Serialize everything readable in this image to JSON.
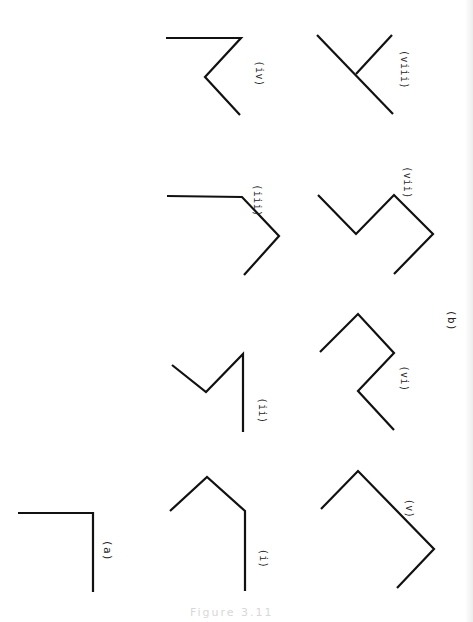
{
  "figure": {
    "caption": "Figure 3.11",
    "stroke_color": "#111111",
    "background": "#ffffff",
    "group_labels": [
      {
        "id": "a",
        "text": "(a)",
        "x": 107,
        "y": 550
      },
      {
        "id": "b",
        "text": "(b)",
        "x": 451,
        "y": 320
      }
    ],
    "panels": [
      {
        "id": "a",
        "label": "(a)",
        "points": [
          [
            18,
            513
          ],
          [
            93,
            513
          ],
          [
            93,
            592
          ]
        ],
        "branch": null
      },
      {
        "id": "i",
        "label": "(i)",
        "label_pos": [
          264,
          558
        ],
        "points": [
          [
            170,
            511
          ],
          [
            207,
            477
          ],
          [
            245,
            511
          ],
          [
            245,
            591
          ]
        ],
        "branch": null
      },
      {
        "id": "ii",
        "label": "(ii)",
        "label_pos": [
          262,
          410
        ],
        "points": [
          [
            172,
            365
          ],
          [
            206,
            392
          ],
          [
            243,
            354
          ],
          [
            243,
            432
          ]
        ],
        "branch": null
      },
      {
        "id": "iii",
        "label": "(iii)",
        "label_pos": [
          257,
          200
        ],
        "points": [
          [
            167,
            196
          ],
          [
            242,
            197
          ],
          [
            279,
            236
          ],
          [
            244,
            275
          ]
        ],
        "branch": null
      },
      {
        "id": "iv",
        "label": "(iv)",
        "label_pos": [
          259,
          73
        ],
        "points": [
          [
            166,
            38
          ],
          [
            241,
            38
          ],
          [
            205,
            77
          ],
          [
            240,
            115
          ]
        ],
        "branch": null
      },
      {
        "id": "v",
        "label": "(v)",
        "label_pos": [
          410,
          508
        ],
        "points": [
          [
            321,
            509
          ],
          [
            358,
            471
          ],
          [
            434,
            549
          ],
          [
            397,
            588
          ]
        ],
        "branch": null
      },
      {
        "id": "vi",
        "label": "(vi)",
        "label_pos": [
          404,
          378
        ],
        "points": [
          [
            320,
            352
          ],
          [
            358,
            314
          ],
          [
            394,
            353
          ],
          [
            358,
            391
          ],
          [
            394,
            430
          ]
        ],
        "branch": null
      },
      {
        "id": "vii",
        "label": "(vii)",
        "label_pos": [
          407,
          182
        ],
        "points": [
          [
            318,
            195
          ],
          [
            356,
            234
          ],
          [
            394,
            195
          ],
          [
            433,
            234
          ],
          [
            394,
            274
          ]
        ],
        "branch": null
      },
      {
        "id": "viii",
        "label": "(viii)",
        "label_pos": [
          404,
          69
        ],
        "points": [
          [
            317,
            35
          ],
          [
            393,
            114
          ]
        ],
        "branch": [
          [
            356,
            74
          ],
          [
            392,
            35
          ]
        ]
      }
    ]
  }
}
